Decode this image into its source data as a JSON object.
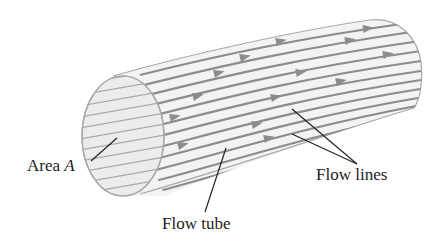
{
  "figure": {
    "type": "flow-tube-diagram",
    "labels": {
      "area": {
        "text": "Area ",
        "variable": "A"
      },
      "flow_tube": "Flow tube",
      "flow_lines": "Flow lines"
    },
    "colors": {
      "background": "#ffffff",
      "tube_fill": "#f3f3f3",
      "end_face_fill": "#ececec",
      "outline": "#a8a8a8",
      "flow_line": "#8c8c8c",
      "arrowhead": "#8c8c8c",
      "leader_line": "#222222",
      "label_text": "#222222"
    },
    "flow_line_count": 12,
    "arrow_count": 14
  }
}
